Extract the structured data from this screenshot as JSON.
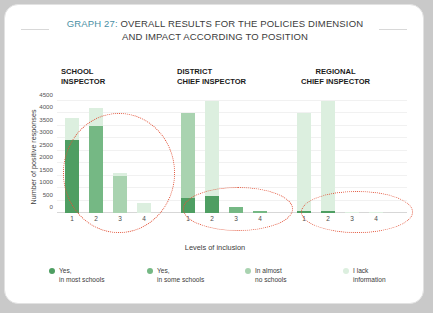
{
  "card": {
    "title_prefix": "GRAPH 27:",
    "title_line1": "OVERALL RESULTS FOR THE POLICIES DIMENSION",
    "title_line2": "AND IMPACT ACCORDING TO POSITION"
  },
  "groups": [
    {
      "header": "SCHOOL\nINSPECTOR"
    },
    {
      "header": "DISTRICT\nCHIEF INSPECTOR"
    },
    {
      "header": "REGIONAL\nCHIEF INSPECTOR"
    }
  ],
  "legend": [
    {
      "label": "Yes,\nin most schools",
      "color": "#4e9e62"
    },
    {
      "label": "Yes,\nin some schools",
      "color": "#75b884"
    },
    {
      "label": "In almost\nno schools",
      "color": "#a9d3b0"
    },
    {
      "label": "I lack\ninformation",
      "color": "#dcefdf"
    }
  ],
  "chart_data": {
    "type": "bar",
    "title": "GRAPH 27: OVERALL RESULTS FOR THE POLICIES DIMENSION AND IMPACT ACCORDING TO POSITION",
    "xlabel": "Levels of inclusion",
    "ylabel": "Number of positive responses",
    "ylim": [
      0,
      4500
    ],
    "yticks": [
      0,
      500,
      1000,
      1500,
      2000,
      2500,
      3000,
      3500,
      4000,
      4500
    ],
    "grid": true,
    "legend_position": "bottom",
    "stacked": true,
    "categories": [
      "1",
      "2",
      "3",
      "4"
    ],
    "series": [
      {
        "name": "Yes, in most schools",
        "color": "#4e9e62"
      },
      {
        "name": "Yes, in some schools",
        "color": "#75b884"
      },
      {
        "name": "In almost no schools",
        "color": "#a9d3b0"
      },
      {
        "name": "I lack information",
        "color": "#dcefdf"
      }
    ],
    "groups": [
      {
        "name": "SCHOOL INSPECTOR",
        "bars": [
          {
            "category": "1",
            "segments": [
              2950,
              0,
              0,
              850
            ],
            "total": 3800
          },
          {
            "category": "2",
            "segments": [
              0,
              3500,
              0,
              700
            ],
            "total": 4200
          },
          {
            "category": "3",
            "segments": [
              0,
              0,
              1500,
              100
            ],
            "total": 1600
          },
          {
            "category": "4",
            "segments": [
              0,
              0,
              0,
              400
            ],
            "total": 400
          }
        ],
        "annotation": "red-dotted-ellipse-around-all-bars"
      },
      {
        "name": "DISTRICT CHIEF INSPECTOR",
        "bars": [
          {
            "category": "1",
            "segments": [
              600,
              0,
              3400,
              0
            ],
            "total": 4000
          },
          {
            "category": "2",
            "segments": [
              700,
              0,
              0,
              3800
            ],
            "total": 4500
          },
          {
            "category": "3",
            "segments": [
              0,
              250,
              0,
              0
            ],
            "total": 250
          },
          {
            "category": "4",
            "segments": [
              0,
              100,
              0,
              0
            ],
            "total": 100
          }
        ],
        "annotation": "red-dotted-ellipse-around-bar-bases"
      },
      {
        "name": "REGIONAL CHIEF INSPECTOR",
        "bars": [
          {
            "category": "1",
            "segments": [
              100,
              0,
              0,
              3900
            ],
            "total": 4000
          },
          {
            "category": "2",
            "segments": [
              100,
              0,
              0,
              4400
            ],
            "total": 4500
          },
          {
            "category": "3",
            "segments": [
              0,
              0,
              0,
              60
            ],
            "total": 60
          },
          {
            "category": "4",
            "segments": [
              0,
              0,
              0,
              40
            ],
            "total": 40
          }
        ],
        "annotation": "red-dotted-ellipse-around-bar-bases"
      }
    ]
  }
}
